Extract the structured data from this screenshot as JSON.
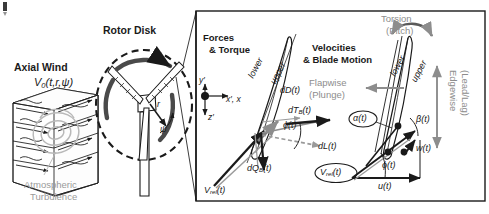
{
  "figure": {
    "background_color": "#ffffff",
    "ink_color": "#1a1a1a",
    "gray_color": "#9a9a9a"
  },
  "left_panel": {
    "axial_wind_title": "Axial Wind",
    "axial_wind_symbol": "V",
    "axial_wind_subscript": "0",
    "axial_wind_args": "(t,r,ψ)",
    "turbulence_label_line1": "Atmospheric",
    "turbulence_label_line2": "Turbulence"
  },
  "rotor_panel": {
    "title": "Rotor Disk",
    "radius_label": "r",
    "azimuth_label": "ψ"
  },
  "forces_panel": {
    "title_line1": "Forces",
    "title_line2": "& Torque",
    "axes": {
      "y_label": "y′",
      "x_label": "x′, x",
      "z_label": "z′"
    },
    "airfoil_surface_lower": "lower",
    "airfoil_surface_upper": "upper",
    "drag_label": "dD(t)",
    "lift_label": "dL(t)",
    "thrust_symbol": "dT",
    "thrust_subscript": "B",
    "thrust_args": "(t)",
    "torque_symbol": "dQ",
    "torque_subscript": "B",
    "torque_args": "(t)",
    "inflow_angle_label": "ϕ(t)",
    "relative_velocity_symbol": "V",
    "relative_velocity_subscript": "rel",
    "relative_velocity_args": "(t)"
  },
  "velocities_panel": {
    "title_line1": "Velocities",
    "title_line2": "& Blade Motion",
    "torsion_line1": "Torsion",
    "torsion_line2": "(Pitch)",
    "flapwise_line1": "Flapwise",
    "flapwise_line2": "(Plunge)",
    "edgewise_line1": "Edgewise",
    "edgewise_line2": "(Lead/Lag)",
    "airfoil_surface_lower": "lower",
    "airfoil_surface_upper": "upper",
    "angle_of_attack_label": "α(t)",
    "pitch_flap_angle_label": "β(t)",
    "inflow_angle_label": "ϕ(t)",
    "normal_velocity_label": "w(t)",
    "tangential_velocity_label": "u(t)",
    "relative_velocity_symbol": "V",
    "relative_velocity_subscript": "rel",
    "relative_velocity_args": "(t)"
  }
}
